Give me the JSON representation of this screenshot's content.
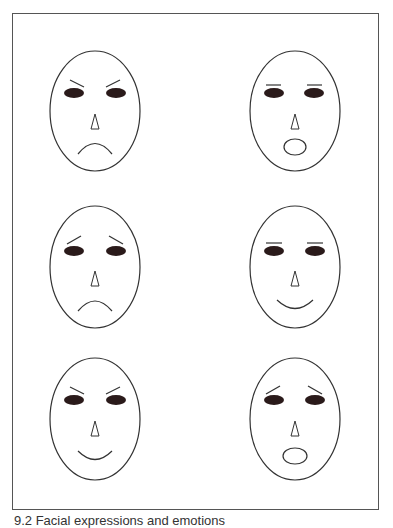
{
  "figure": {
    "caption": "9.2 Facial expressions and emotions",
    "colors": {
      "line": "#333333",
      "eye": "#2a1a1a",
      "frame": "#555555",
      "background": "#ffffff"
    },
    "faces": [
      {
        "id": "angry-sad",
        "row": 1,
        "col": 1,
        "cx": 95,
        "cy": 111,
        "brows": "angry",
        "mouth": "frown"
      },
      {
        "id": "neutral-surprised",
        "row": 1,
        "col": 2,
        "cx": 295,
        "cy": 111,
        "brows": "flat",
        "mouth": "open"
      },
      {
        "id": "sad",
        "row": 2,
        "col": 1,
        "cx": 95,
        "cy": 267,
        "brows": "worried",
        "mouth": "frown"
      },
      {
        "id": "happy",
        "row": 2,
        "col": 2,
        "cx": 295,
        "cy": 267,
        "brows": "flat",
        "mouth": "smile"
      },
      {
        "id": "angry-smile",
        "row": 3,
        "col": 1,
        "cx": 95,
        "cy": 419,
        "brows": "angry",
        "mouth": "smile"
      },
      {
        "id": "worried-surprised",
        "row": 3,
        "col": 2,
        "cx": 295,
        "cy": 419,
        "brows": "worried",
        "mouth": "open"
      }
    ]
  }
}
